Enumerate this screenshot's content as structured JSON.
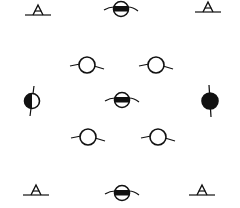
{
  "diagram": {
    "type": "symmetry-element-pattern",
    "width": 240,
    "height": 208,
    "background": "#ffffff",
    "stroke": "#111111",
    "symbols": [
      {
        "id": "s1",
        "kind": "triangle-on-line",
        "x": 38,
        "y": 12
      },
      {
        "id": "s2",
        "kind": "circle-horizontal-band",
        "x": 121,
        "y": 9
      },
      {
        "id": "s3",
        "kind": "triangle-on-line",
        "x": 208,
        "y": 9
      },
      {
        "id": "s4",
        "kind": "open-circle-with-tails",
        "x": 87,
        "y": 65
      },
      {
        "id": "s5",
        "kind": "open-circle-with-tails",
        "x": 156,
        "y": 65
      },
      {
        "id": "s6",
        "kind": "circle-half-filled",
        "x": 32,
        "y": 101
      },
      {
        "id": "s7",
        "kind": "circle-horizontal-band",
        "x": 122,
        "y": 100
      },
      {
        "id": "s8",
        "kind": "filled-circle-with-axis",
        "x": 210,
        "y": 101
      },
      {
        "id": "s9",
        "kind": "open-circle-with-tails",
        "x": 88,
        "y": 137
      },
      {
        "id": "s10",
        "kind": "open-circle-with-tails",
        "x": 158,
        "y": 137
      },
      {
        "id": "s11",
        "kind": "triangle-on-line",
        "x": 36,
        "y": 192
      },
      {
        "id": "s12",
        "kind": "circle-horizontal-band",
        "x": 122,
        "y": 193
      },
      {
        "id": "s13",
        "kind": "triangle-on-line",
        "x": 202,
        "y": 192
      }
    ]
  }
}
